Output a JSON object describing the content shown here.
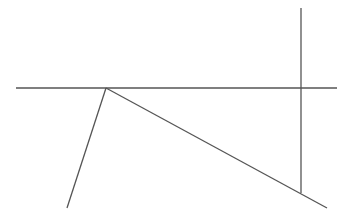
{
  "diagram": {
    "width": 353,
    "height": 214,
    "stroke_color": "#555555",
    "background": "#ffffff",
    "lines": [
      {
        "name": "horizontal-line",
        "x1": 16,
        "y1": 88,
        "x2": 337,
        "y2": 88
      },
      {
        "name": "vertical-line",
        "x1": 301,
        "y1": 8,
        "x2": 301,
        "y2": 193
      },
      {
        "name": "left-slant-line",
        "x1": 106,
        "y1": 88,
        "x2": 67,
        "y2": 208
      },
      {
        "name": "diagonal-line",
        "x1": 106,
        "y1": 88,
        "x2": 327,
        "y2": 208
      }
    ]
  }
}
